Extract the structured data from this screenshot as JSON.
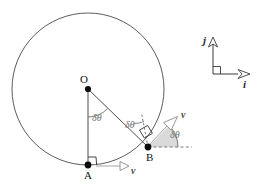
{
  "figure": {
    "title": "",
    "points": [
      {
        "id": "O",
        "label": "O",
        "x": 88,
        "y": 89,
        "label_x": 80,
        "label_y": 74
      },
      {
        "id": "A",
        "label": "A",
        "x": 88,
        "y": 165,
        "label_x": 84,
        "label_y": 170
      },
      {
        "id": "B",
        "label": "B",
        "x": 148,
        "y": 147,
        "label_x": 146,
        "label_y": 152
      }
    ],
    "angles": [
      {
        "id": "angle-at-O",
        "label": "δθ",
        "label_x": 92,
        "label_y": 113
      },
      {
        "id": "angle-at-B-radius",
        "label": "δθ",
        "label_x": 125,
        "label_y": 120
      },
      {
        "id": "angle-at-B-velocity",
        "label": "δθ",
        "label_x": 170,
        "label_y": 130
      }
    ],
    "vectors": [
      {
        "id": "velocity-at-A",
        "label": "v",
        "label_x": 131,
        "label_y": 166
      },
      {
        "id": "velocity-at-B",
        "label": "v",
        "label_x": 181,
        "label_y": 110
      }
    ],
    "basis": {
      "origin_x": 213,
      "origin_y": 74,
      "i": {
        "label": "i",
        "label_x": 243,
        "label_y": 79
      },
      "j": {
        "label": "j",
        "label_x": 203,
        "label_y": 35
      }
    },
    "circle": {
      "cx": 88,
      "cy": 89,
      "r": 76
    },
    "colors": {
      "stroke": "#3a3a3a",
      "circle": "#4a4a4a",
      "angle_text": "#6e6e6e",
      "wedge_fill": "#d6d6d6",
      "vector_stroke": "#8c8c8c",
      "dashed": "#6a6a6a",
      "point_fill": "#0d0d0d",
      "basis_stroke": "#3a3a3a"
    }
  }
}
